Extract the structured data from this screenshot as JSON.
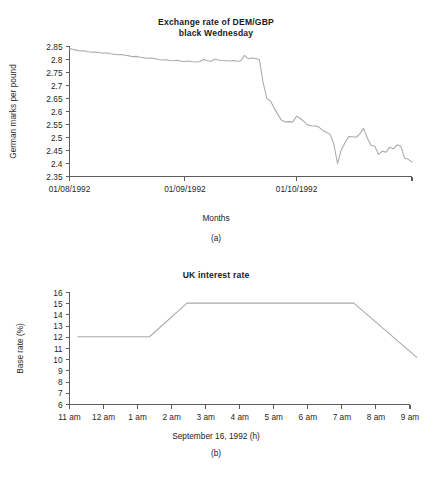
{
  "figures": [
    {
      "tag": "(a)",
      "title_line1": "Exchange rate of DEM/GBP",
      "title_line2": "black Wednesday",
      "xlabel": "Months",
      "chart_data": {
        "type": "line",
        "title": "Exchange rate of DEM/GBP black Wednesday",
        "xlabel": "Months",
        "ylabel": "German marks per pound",
        "ylim": [
          2.35,
          2.85
        ],
        "yticks": [
          "2.35",
          "2.4",
          "2.45",
          "2.5",
          "2.55",
          "2.6",
          "2.65",
          "2.7",
          "2.75",
          "2.8",
          "2.85"
        ],
        "xticks": [
          "01/08/1992",
          "01/09/1992",
          "01/10/1992"
        ],
        "xtick_positions": [
          0,
          31,
          61
        ],
        "xlim": [
          0,
          92
        ],
        "grid": false,
        "legend": "none",
        "line_color": "#a9a9a9",
        "series": [
          {
            "name": "DEM per GBP",
            "x": [
              0,
              1,
              2,
              3,
              4,
              5,
              6,
              7,
              8,
              9,
              10,
              11,
              12,
              13,
              14,
              15,
              16,
              17,
              18,
              19,
              20,
              21,
              22,
              23,
              24,
              25,
              26,
              27,
              28,
              29,
              30,
              31,
              32,
              33,
              34,
              35,
              36,
              37,
              38,
              39,
              40,
              41,
              42,
              43,
              44,
              45,
              46,
              47,
              48,
              49,
              50,
              51,
              52,
              53,
              54,
              55,
              56,
              57,
              58,
              59,
              60,
              61,
              62,
              63,
              64,
              65,
              66,
              67,
              68,
              69,
              70,
              71,
              72,
              73,
              74,
              75,
              76,
              77,
              78,
              79,
              80,
              81,
              82,
              83,
              84,
              85,
              86,
              87,
              88,
              89,
              90,
              91,
              92
            ],
            "values": [
              2.843,
              2.838,
              2.836,
              2.833,
              2.834,
              2.83,
              2.828,
              2.829,
              2.827,
              2.824,
              2.826,
              2.822,
              2.82,
              2.818,
              2.819,
              2.816,
              2.814,
              2.811,
              2.812,
              2.809,
              2.807,
              2.805,
              2.806,
              2.803,
              2.8,
              2.798,
              2.799,
              2.796,
              2.795,
              2.797,
              2.793,
              2.792,
              2.794,
              2.791,
              2.79,
              2.792,
              2.8,
              2.795,
              2.793,
              2.802,
              2.798,
              2.796,
              2.795,
              2.794,
              2.796,
              2.793,
              2.795,
              2.816,
              2.803,
              2.806,
              2.804,
              2.8,
              2.712,
              2.65,
              2.64,
              2.612,
              2.588,
              2.566,
              2.56,
              2.561,
              2.56,
              2.582,
              2.573,
              2.561,
              2.548,
              2.545,
              2.544,
              2.54,
              2.527,
              2.52,
              2.512,
              2.475,
              2.4,
              2.452,
              2.48,
              2.504,
              2.503,
              2.501,
              2.514,
              2.535,
              2.498,
              2.47,
              2.466,
              2.435,
              2.448,
              2.443,
              2.463,
              2.456,
              2.472,
              2.466,
              2.421,
              2.416,
              2.405
            ]
          }
        ]
      }
    },
    {
      "tag": "(b)",
      "title_line1": "UK interest rate",
      "title_line2": "",
      "xlabel": "September 16, 1992 (h)",
      "chart_data": {
        "type": "line",
        "title": "UK interest rate",
        "xlabel": "September 16, 1992 (h)",
        "ylabel": "Base rate (%)",
        "ylim": [
          6,
          16
        ],
        "yticks": [
          "6",
          "7",
          "8",
          "9",
          "10",
          "11",
          "12",
          "13",
          "14",
          "15",
          "16"
        ],
        "xticks": [
          "11 am",
          "12 am",
          "1 am",
          "2 am",
          "3 am",
          "4 am",
          "5 am",
          "6 am",
          "7 am",
          "8 am",
          "9 am"
        ],
        "xlim": [
          0,
          10
        ],
        "grid": false,
        "legend": "none",
        "line_color": "#a9a9a9",
        "series": [
          {
            "name": "Base rate",
            "x": [
              0.25,
              2.35,
              3.45,
              8.35,
              10.2
            ],
            "values": [
              12.05,
              12.05,
              15.05,
              15.05,
              10.2
            ]
          }
        ]
      }
    }
  ]
}
